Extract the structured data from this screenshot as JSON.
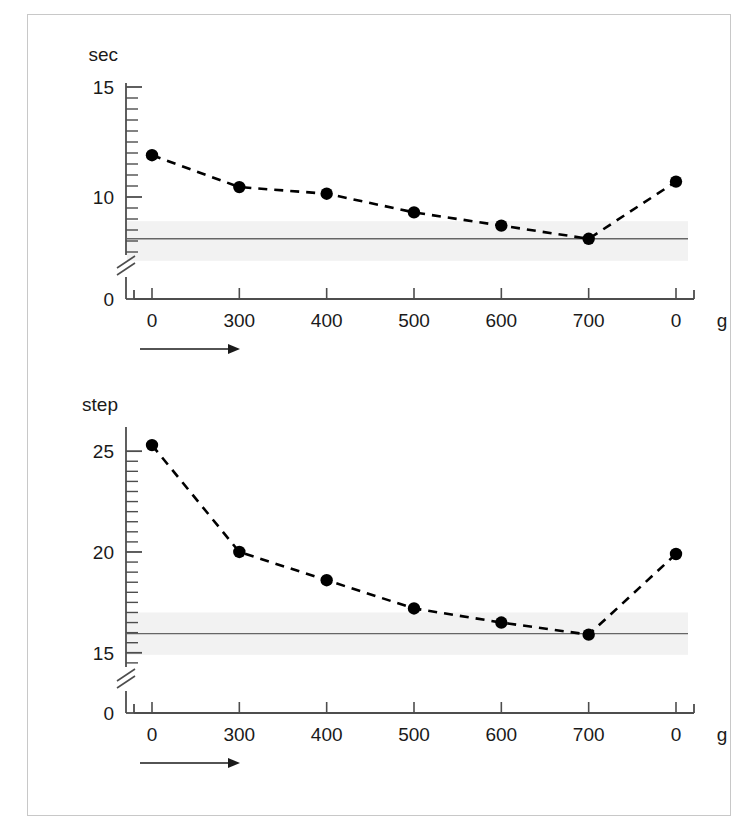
{
  "figure": {
    "border_color": "#c8c8c8",
    "background": "#ffffff",
    "series_color": "#000000",
    "band_color": "#f2f2f2",
    "reference_line_color": "#666666",
    "axis_color": "#4d4d4d"
  },
  "chart_data": [
    {
      "id": "chart-top",
      "type": "line",
      "title": "",
      "ylabel": "sec",
      "xlabel": "g",
      "categories": [
        "0",
        "300",
        "400",
        "500",
        "600",
        "700",
        "0"
      ],
      "x": [
        0,
        300,
        400,
        500,
        600,
        700,
        0
      ],
      "values": [
        11.9,
        10.45,
        10.15,
        9.3,
        8.7,
        8.1,
        10.7
      ],
      "ylim": [
        7.0,
        15.0
      ],
      "yticks_labeled": [
        {
          "value": 15,
          "label": "15"
        },
        {
          "value": 10,
          "label": "10"
        }
      ],
      "yticks_minor_count": 17,
      "axis_break": true,
      "axis_break_label": "0",
      "grid": false,
      "legend": "none",
      "linestyle": "dashed",
      "marker": "filled-circle",
      "reference_line": {
        "value": 8.1,
        "label": ""
      },
      "reference_band": {
        "low": 7.1,
        "high": 8.9,
        "label": ""
      },
      "direction_arrow": true
    },
    {
      "id": "chart-bottom",
      "type": "line",
      "title": "",
      "ylabel": "step",
      "xlabel": "g",
      "categories": [
        "0",
        "300",
        "400",
        "500",
        "600",
        "700",
        "0"
      ],
      "x": [
        0,
        300,
        400,
        500,
        600,
        700,
        0
      ],
      "values": [
        25.3,
        20.0,
        18.6,
        17.2,
        16.5,
        15.9,
        19.9
      ],
      "ylim": [
        13.8,
        26.0
      ],
      "yticks_labeled": [
        {
          "value": 25,
          "label": "25"
        },
        {
          "value": 20,
          "label": "20"
        },
        {
          "value": 15,
          "label": "15"
        }
      ],
      "yticks_minor_count": 19,
      "axis_break": true,
      "axis_break_label": "0",
      "grid": false,
      "legend": "none",
      "linestyle": "dashed",
      "marker": "filled-circle",
      "reference_line": {
        "value": 15.95,
        "label": ""
      },
      "reference_band": {
        "low": 14.9,
        "high": 17.0,
        "label": ""
      },
      "direction_arrow": true
    }
  ]
}
